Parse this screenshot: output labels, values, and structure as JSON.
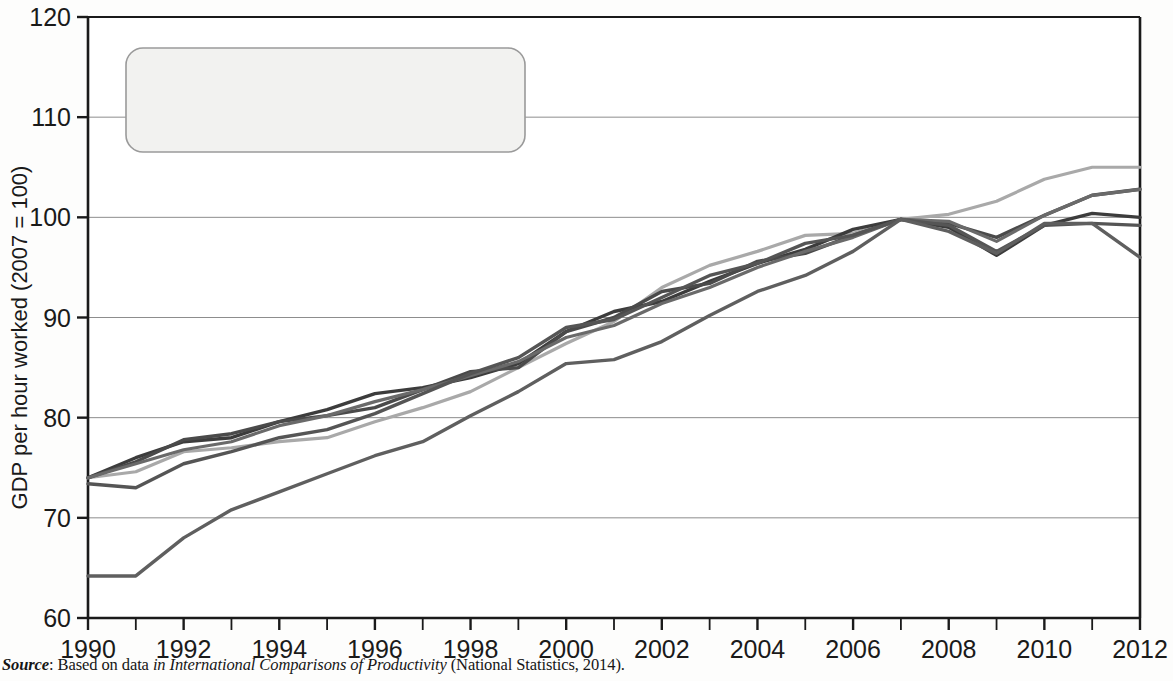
{
  "figure": {
    "source_prefix": "Source",
    "source_colon": ": Based on data ",
    "source_italic_a": "in International Comparisons of Productivity",
    "source_tail": " (National Statistics, 2014)."
  },
  "legend": {
    "items": [
      {
        "label": "USA",
        "color": "#a9a9a9"
      },
      {
        "label": "Germany",
        "color": "#3c3c3c"
      },
      {
        "label": "France",
        "color": "#4a4a4a"
      },
      {
        "label": "G7 excluding UK",
        "color": "#6a6a6a"
      },
      {
        "label": "UK",
        "color": "#555555"
      },
      {
        "label": "Japan",
        "color": "#5f5f5f"
      }
    ]
  },
  "chart_data": {
    "type": "line",
    "title": "",
    "xlabel": "",
    "ylabel": "GDP per hour worked (2007 = 100)",
    "xlim": [
      1990,
      2012
    ],
    "ylim": [
      60,
      120
    ],
    "yticks": [
      60,
      70,
      80,
      90,
      100,
      110,
      120
    ],
    "xticks": [
      1990,
      1992,
      1994,
      1996,
      1998,
      2000,
      2002,
      2004,
      2006,
      2008,
      2010,
      2012
    ],
    "xtick_labels": [
      "1990",
      "1992",
      "1994",
      "1996",
      "1998",
      "2000",
      "2002",
      "2004",
      "2006",
      "2008",
      "2010",
      "2012"
    ],
    "ytick_labels": [
      "60",
      "70",
      "80",
      "90",
      "100",
      "110",
      "120"
    ],
    "x_minor_every": 1,
    "grid": "horizontal",
    "legend_position": "top-left",
    "x": [
      1990,
      1991,
      1992,
      1993,
      1994,
      1995,
      1996,
      1997,
      1998,
      1999,
      2000,
      2001,
      2002,
      2003,
      2004,
      2005,
      2006,
      2007,
      2008,
      2009,
      2010,
      2011,
      2012
    ],
    "series": [
      {
        "name": "USA",
        "color": "#a9a9a9",
        "width": 3.2,
        "values": [
          74.0,
          74.6,
          76.6,
          77.0,
          77.6,
          78.0,
          79.6,
          81.0,
          82.6,
          85.0,
          87.4,
          89.6,
          93.0,
          95.2,
          96.6,
          98.2,
          98.4,
          99.8,
          100.3,
          101.6,
          103.8,
          105.0,
          105.0
        ]
      },
      {
        "name": "Germany",
        "color": "#3c3c3c",
        "width": 3.4,
        "values": [
          74.0,
          76.0,
          77.6,
          78.0,
          79.6,
          80.8,
          82.4,
          83.0,
          84.0,
          85.4,
          88.6,
          90.6,
          91.6,
          93.6,
          95.4,
          96.8,
          98.8,
          99.8,
          99.0,
          96.2,
          99.2,
          100.4,
          100.0
        ]
      },
      {
        "name": "France",
        "color": "#4a4a4a",
        "width": 3.4,
        "values": [
          74.0,
          75.6,
          77.8,
          78.4,
          79.6,
          80.2,
          81.0,
          82.8,
          84.6,
          85.0,
          88.6,
          90.0,
          92.6,
          93.4,
          95.6,
          96.4,
          98.2,
          99.8,
          99.4,
          98.0,
          100.2,
          102.2,
          102.8
        ]
      },
      {
        "name": "G7 excluding UK",
        "color": "#6a6a6a",
        "width": 3.2,
        "values": [
          74.0,
          75.4,
          76.8,
          77.6,
          79.2,
          80.2,
          81.6,
          82.8,
          84.2,
          85.6,
          88.0,
          89.2,
          91.4,
          93.0,
          95.0,
          96.6,
          98.0,
          99.8,
          99.6,
          97.6,
          100.2,
          102.2,
          102.8
        ]
      },
      {
        "name": "UK",
        "color": "#555555",
        "width": 3.4,
        "values": [
          73.4,
          73.0,
          75.4,
          76.6,
          78.0,
          78.8,
          80.4,
          82.4,
          84.4,
          86.0,
          89.0,
          89.8,
          92.0,
          94.2,
          95.4,
          97.4,
          98.2,
          99.8,
          99.2,
          96.6,
          99.2,
          99.4,
          99.2
        ]
      },
      {
        "name": "Japan",
        "color": "#5f5f5f",
        "width": 3.4,
        "values": [
          64.2,
          64.2,
          68.0,
          70.8,
          72.6,
          74.4,
          76.2,
          77.6,
          80.2,
          82.6,
          85.4,
          85.8,
          87.6,
          90.2,
          92.6,
          94.2,
          96.6,
          99.8,
          98.6,
          96.4,
          99.4,
          99.4,
          96.0
        ]
      }
    ]
  }
}
